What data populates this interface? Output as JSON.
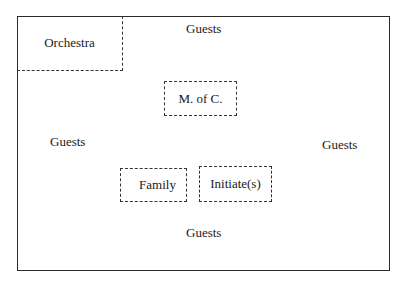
{
  "diagram": {
    "type": "seating-layout",
    "areas": {
      "orchestra": "Orchestra",
      "mc": "M.  of  C.",
      "family": "Family",
      "initiates": "Initiate(s)"
    },
    "guests": {
      "top": "Guests",
      "left": "Guests",
      "right": "Guests",
      "bottom": "Guests"
    }
  }
}
